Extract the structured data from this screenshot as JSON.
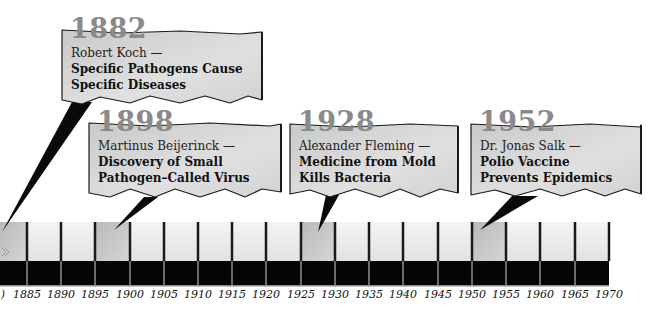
{
  "timeline": {
    "start_year": 1880,
    "end_year": 1970,
    "step": 5,
    "tick_labels": [
      "1885",
      "1890",
      "1895",
      "1900",
      "1905",
      "1910",
      "1915",
      "1920",
      "1925",
      "1930",
      "1935",
      "1940",
      "1945",
      "1950",
      "1955",
      "1960",
      "1965",
      "1970"
    ],
    "partial_left_label": ")",
    "colors": {
      "band_light": "#ececec",
      "band_highlight": "#c4c4c4",
      "band_dark": "#050505",
      "divider": "#1a1a1a",
      "label": "#111111"
    }
  },
  "events": [
    {
      "year": "1882",
      "person": "Robert Koch —",
      "line1": "Specific Pathogens Cause",
      "line2": "Specific Diseases"
    },
    {
      "year": "1898",
      "person": "Martinus Beijerinck —",
      "line1": "Discovery of Small",
      "line2": "Pathogen–Called Virus"
    },
    {
      "year": "1928",
      "person": "Alexander Fleming —",
      "line1": "Medicine from Mold",
      "line2": "Kills Bacteria"
    },
    {
      "year": "1952",
      "person": "Dr. Jonas Salk —",
      "line1": "Polio Vaccine",
      "line2": "Prevents Epidemics"
    }
  ],
  "style": {
    "callout_fill": "#d9d9d9",
    "callout_stroke": "#1a1a1a",
    "year_color": "#8a8a8a"
  }
}
